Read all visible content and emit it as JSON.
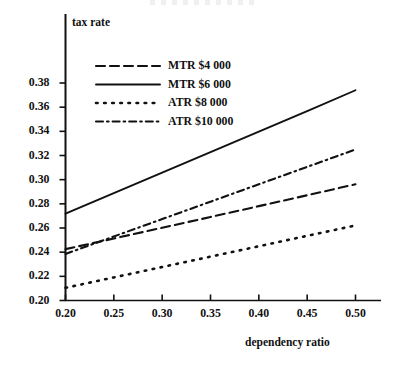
{
  "chart_data": {
    "type": "line",
    "title": "",
    "xlabel": "dependency ratio",
    "ylabel": "tax rate",
    "xlim": [
      0.2,
      0.5
    ],
    "ylim": [
      0.2,
      0.39
    ],
    "xticks": [
      "0.20",
      "0.25",
      "0.30",
      "0.35",
      "0.40",
      "0.45",
      "0.50"
    ],
    "xtick_values": [
      0.2,
      0.25,
      0.3,
      0.35,
      0.4,
      0.45,
      0.5
    ],
    "yticks": [
      "0.20",
      "0.22",
      "0.24",
      "0.26",
      "0.28",
      "0.30",
      "0.32",
      "0.34",
      "0.36",
      "0.38"
    ],
    "ytick_values": [
      0.2,
      0.22,
      0.24,
      0.26,
      0.28,
      0.3,
      0.32,
      0.34,
      0.36,
      0.38
    ],
    "grid": false,
    "legend_position": "upper left",
    "x": [
      0.2,
      0.25,
      0.3,
      0.35,
      0.4,
      0.45,
      0.5
    ],
    "series": [
      {
        "name": "MTR $4 000",
        "style": "dashed",
        "color": "#111111",
        "values": [
          0.2425,
          0.2513,
          0.2602,
          0.2691,
          0.2781,
          0.2871,
          0.2962
        ]
      },
      {
        "name": "MTR $6 000",
        "style": "solid",
        "color": "#111111",
        "values": [
          0.2718,
          0.2888,
          0.3058,
          0.3228,
          0.3398,
          0.3568,
          0.374
        ]
      },
      {
        "name": "ATR $8 000",
        "style": "dotted",
        "color": "#111111",
        "values": [
          0.2105,
          0.2191,
          0.2277,
          0.2363,
          0.2449,
          0.2535,
          0.2621
        ]
      },
      {
        "name": "ATR $10 000",
        "style": "dashdot",
        "color": "#111111",
        "values": [
          0.2385,
          0.253,
          0.2674,
          0.2818,
          0.2962,
          0.3106,
          0.325
        ]
      }
    ]
  },
  "legend": {
    "items": [
      {
        "label": "MTR $4 000"
      },
      {
        "label": "MTR $6 000"
      },
      {
        "label": "ATR $8 000"
      },
      {
        "label": "ATR $10 000"
      }
    ]
  },
  "axis": {
    "y_title": "tax rate",
    "x_title": "dependency ratio"
  }
}
